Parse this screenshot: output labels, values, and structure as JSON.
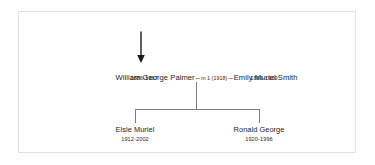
{
  "diagram": {
    "type": "family-tree",
    "pointer": {
      "icon": "down-arrow-icon",
      "direction": "down",
      "points_to": "union-line"
    },
    "union": {
      "father": {
        "name": "William George Palmer",
        "dates": "1886-1967"
      },
      "mother": {
        "name": "Emily Muriel Smith",
        "dates": "1889-1969"
      },
      "separator_left": "–",
      "separator_right": "–",
      "marriage_note": "m 1 (1918)"
    },
    "children": [
      {
        "name": "Elsie Muriel",
        "dates": "1912-2002"
      },
      {
        "name": "Ronald George",
        "dates": "1920-1996"
      }
    ]
  },
  "style": {
    "page_background": "#ffffff",
    "frame_border": "#e3e3e3",
    "text_color": "#1a1a1a",
    "line_color": "#7d7d7d",
    "arrow_color": "#1a1a1a"
  }
}
